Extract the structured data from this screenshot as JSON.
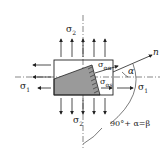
{
  "labels": {
    "sigma2_top": "σ",
    "sigma2_top_sub": "2",
    "sigma2_bottom": "σ",
    "sigma2_bottom_sub": "2",
    "sigma1_left": "σ",
    "sigma1_left_sub": "1",
    "sigma1_right": "σ",
    "sigma1_right_sub": "1",
    "sigma_alpha": "σ",
    "sigma_alpha_sub": "αα",
    "sigma_alpha_s": "σ",
    "sigma_alpha_s_sub": "αs",
    "normal": "n",
    "alpha": "α",
    "angle_relation": "90°+ α=β"
  },
  "colors": {
    "line": "#222222",
    "shade": "#9a9a9a",
    "axis": "#555555"
  }
}
